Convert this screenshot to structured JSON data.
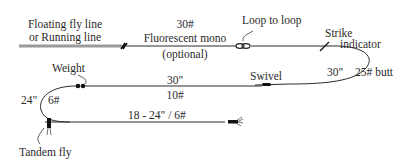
{
  "diagram": {
    "labels": {
      "fly_line_1": "Floating fly line",
      "fly_line_2": "or Running line",
      "mono_weight": "30#",
      "mono_name": "Fluorescent mono",
      "mono_optional": "(optional)",
      "loop": "Loop to loop",
      "strike_1": "Strike",
      "strike_2": "indicator",
      "butt_length": "30\"",
      "butt_weight": "25# butt",
      "weight": "Weight",
      "swivel": "Swivel",
      "mid_length": "30\"",
      "mid_weight": "10#",
      "dropper_length": "24\"",
      "dropper_weight": "6#",
      "tippet": "18 - 24\" / 6#",
      "tandem_fly": "Tandem fly"
    },
    "colors": {
      "line": "#2a2a2a",
      "fly_line": "#9a9a9a",
      "background": "#ffffff"
    }
  }
}
